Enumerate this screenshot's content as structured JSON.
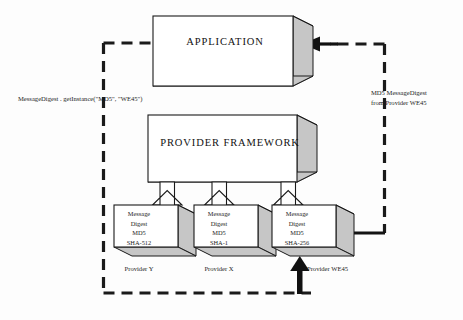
{
  "diagram": {
    "title_app": "APPLICATION",
    "title_framework": "PROVIDER FRAMEWORK",
    "call_label": "MessageDigest . getInstance(\"MD5\", \"WE45\")",
    "return_label_line1": "MD5 MessageDigest",
    "return_label_line2": "from Provider WE45",
    "providers": [
      {
        "line1": "Message",
        "line2": "Digest",
        "line3": "MD5",
        "line4": "SHA-512",
        "caption": "Provider Y"
      },
      {
        "line1": "Message",
        "line2": "Digest",
        "line3": "MD5",
        "line4": "SHA-1",
        "caption": "Provider X"
      },
      {
        "line1": "Message",
        "line2": "Digest",
        "line3": "MD5",
        "line4": "SHA-256",
        "caption": "Provider WE45"
      }
    ],
    "colors": {
      "background": "#fdfdfd",
      "box_face": "#ffffff",
      "box_shade": "#c9c9c9",
      "box_shade_dark": "#b5b5b5",
      "outline": "#1a1a1a",
      "dashed_line": "#1a1a1a",
      "arrow_solid": "#111111"
    }
  }
}
